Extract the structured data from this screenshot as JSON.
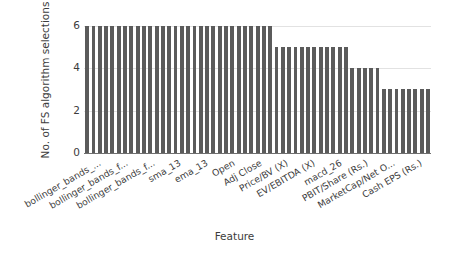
{
  "chart_data": {
    "type": "bar",
    "title": "",
    "xlabel": "Feature",
    "ylabel": "No. of FS algorithm selections",
    "ylim": [
      0,
      6.4
    ],
    "yticks": [
      0,
      2,
      4,
      6
    ],
    "grid": true,
    "legend": null,
    "bar_color": "#5b5b5b",
    "axis_color": "#6f6f6f",
    "grid_color": "#e2e2e2",
    "tick_label_color": "#3c3c3c",
    "x_tick_labels": [
      "bollinger_bands_...",
      "bollinger_bands_f...",
      "bollinger_bands_f...",
      "sma_13",
      "ema_13",
      "Open",
      "Adj Close",
      "Price/BV (X)",
      "EV/EBITDA (X)",
      "macd_26",
      "PBIT/Share (Rs.)",
      "MarketCap/Net O...",
      "Cash EPS (Rs.)"
    ],
    "n_bars": 55,
    "values": [
      6,
      6,
      6,
      6,
      6,
      6,
      6,
      6,
      6,
      6,
      6,
      6,
      6,
      6,
      6,
      6,
      6,
      6,
      6,
      6,
      6,
      6,
      6,
      6,
      6,
      6,
      6,
      6,
      6,
      6,
      5,
      5,
      5,
      5,
      5,
      5,
      5,
      5,
      5,
      5,
      5,
      5,
      4,
      4,
      4,
      4,
      4,
      3,
      3,
      3,
      3,
      3,
      3,
      3,
      3
    ]
  }
}
